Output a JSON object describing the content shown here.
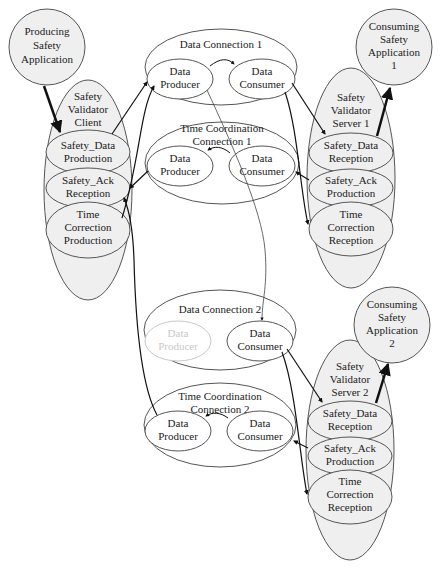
{
  "diagram": {
    "producing_app": {
      "lines": [
        "Producing",
        "Safety",
        "Application"
      ]
    },
    "client": {
      "title": [
        "Safety",
        "Validator",
        "Client"
      ],
      "items": [
        {
          "lines": [
            "Safety_Data",
            "Production"
          ]
        },
        {
          "lines": [
            "Safety_Ack",
            "Reception"
          ]
        },
        {
          "lines": [
            "Time",
            "Correction",
            "Production"
          ]
        }
      ]
    },
    "data_connection_1": {
      "title": "Data Connection 1",
      "producer": [
        "Data",
        "Producer"
      ],
      "consumer": [
        "Data",
        "Consumer"
      ]
    },
    "time_coord_1": {
      "title": [
        "Time Coordination",
        "Connection 1"
      ],
      "producer": [
        "Data",
        "Producer"
      ],
      "consumer": [
        "Data",
        "Consumer"
      ]
    },
    "data_connection_2": {
      "title": "Data Connection 2",
      "producer": [
        "Data",
        "Producer"
      ],
      "consumer": [
        "Data",
        "Consumer"
      ]
    },
    "time_coord_2": {
      "title": [
        "Time Coordination",
        "Connection 2"
      ],
      "producer": [
        "Data",
        "Producer"
      ],
      "consumer": [
        "Data",
        "Consumer"
      ]
    },
    "server_1": {
      "title": [
        "Safety",
        "Validator",
        "Server 1"
      ],
      "items": [
        {
          "lines": [
            "Safety_Data",
            "Reception"
          ]
        },
        {
          "lines": [
            "Safety_Ack",
            "Production"
          ]
        },
        {
          "lines": [
            "Time",
            "Correction",
            "Reception"
          ]
        }
      ]
    },
    "server_2": {
      "title": [
        "Safety",
        "Validator",
        "Server 2"
      ],
      "items": [
        {
          "lines": [
            "Safety_Data",
            "Reception"
          ]
        },
        {
          "lines": [
            "Safety_Ack",
            "Production"
          ]
        },
        {
          "lines": [
            "Time",
            "Correction",
            "Reception"
          ]
        }
      ]
    },
    "consuming_app_1": {
      "lines": [
        "Consuming",
        "Safety",
        "Application",
        "1"
      ]
    },
    "consuming_app_2": {
      "lines": [
        "Consuming",
        "Safety",
        "Application",
        "2"
      ]
    }
  },
  "colors": {
    "fill": "#efefef",
    "stroke": "#555555",
    "arrow": "#111111",
    "faded": "#c8c8c8"
  }
}
